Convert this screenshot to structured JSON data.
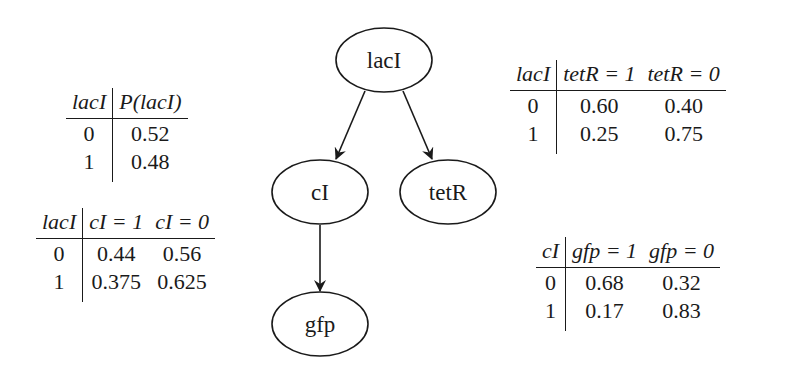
{
  "diagram": {
    "type": "bayesian-network",
    "nodes": [
      {
        "id": "lacI",
        "label": "lacI",
        "cx": 384,
        "cy": 60
      },
      {
        "id": "cI",
        "label": "cI",
        "cx": 320,
        "cy": 192
      },
      {
        "id": "tetR",
        "label": "tetR",
        "cx": 448,
        "cy": 192
      },
      {
        "id": "gfp",
        "label": "gfp",
        "cx": 320,
        "cy": 324
      }
    ],
    "edges": [
      {
        "from": "lacI",
        "to": "cI"
      },
      {
        "from": "lacI",
        "to": "tetR"
      },
      {
        "from": "cI",
        "to": "gfp"
      }
    ]
  },
  "tables": {
    "lacI_prior": {
      "headers": [
        "lacI",
        "P(lacI)"
      ],
      "rows": [
        [
          "0",
          "0.52"
        ],
        [
          "1",
          "0.48"
        ]
      ]
    },
    "cI_given_lacI": {
      "headers": [
        "lacI",
        "cI = 1",
        "cI = 0"
      ],
      "rows": [
        [
          "0",
          "0.44",
          "0.56"
        ],
        [
          "1",
          "0.375",
          "0.625"
        ]
      ]
    },
    "tetR_given_lacI": {
      "headers": [
        "lacI",
        "tetR = 1",
        "tetR = 0"
      ],
      "rows": [
        [
          "0",
          "0.60",
          "0.40"
        ],
        [
          "1",
          "0.25",
          "0.75"
        ]
      ]
    },
    "gfp_given_cI": {
      "headers": [
        "cI",
        "gfp = 1",
        "gfp = 0"
      ],
      "rows": [
        [
          "0",
          "0.68",
          "0.32"
        ],
        [
          "1",
          "0.17",
          "0.83"
        ]
      ]
    }
  }
}
